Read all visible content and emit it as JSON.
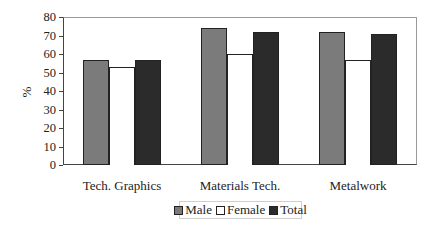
{
  "chart_data": {
    "type": "bar",
    "title": "",
    "xlabel": "",
    "ylabel": "%",
    "ylim": [
      0,
      80
    ],
    "yticks": [
      0,
      10,
      20,
      30,
      40,
      50,
      60,
      70,
      80
    ],
    "grid": false,
    "legend_position": "bottom",
    "categories": [
      "Tech. Graphics",
      "Materials Tech.",
      "Metalwork"
    ],
    "series": [
      {
        "name": "Male",
        "color": "#7b7b7b",
        "values": [
          57,
          74,
          72
        ]
      },
      {
        "name": "Female",
        "color": "#ffffff",
        "values": [
          53,
          60,
          57
        ]
      },
      {
        "name": "Total",
        "color": "#2b2b2b",
        "values": [
          57,
          72,
          71
        ]
      }
    ]
  }
}
